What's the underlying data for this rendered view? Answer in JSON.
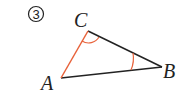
{
  "problem_number": "3",
  "vertices": {
    "A": {
      "label": "A",
      "x": 61,
      "y": 78
    },
    "B": {
      "label": "B",
      "x": 162,
      "y": 67
    },
    "C": {
      "label": "C",
      "x": 88,
      "y": 31
    }
  },
  "colors": {
    "highlight": "#e8623a",
    "line": "#222222"
  },
  "highlighted_side": "AC",
  "marked_angles": [
    "C",
    "B"
  ]
}
